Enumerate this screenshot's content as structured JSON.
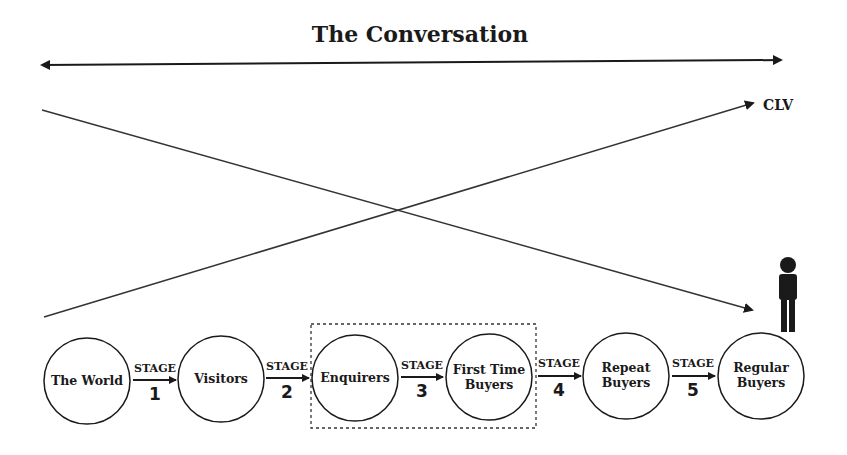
{
  "title": "The Conversation",
  "clv_label": "CLV",
  "colors": {
    "ink": "#1a1a1a",
    "background": "#ffffff"
  },
  "nodes": [
    {
      "id": "the-world",
      "lines": [
        "The World"
      ],
      "cx": 87,
      "cy": 381
    },
    {
      "id": "visitors",
      "lines": [
        "Visitors"
      ],
      "cx": 221,
      "cy": 379
    },
    {
      "id": "enquirers",
      "lines": [
        "Enquirers"
      ],
      "cx": 355,
      "cy": 378
    },
    {
      "id": "first-time-buyers",
      "lines": [
        "First Time",
        "Buyers"
      ],
      "cx": 489,
      "cy": 377
    },
    {
      "id": "repeat-buyers",
      "lines": [
        "Repeat",
        "Buyers"
      ],
      "cx": 626,
      "cy": 376
    },
    {
      "id": "regular-buyers",
      "lines": [
        "Regular",
        "Buyers"
      ],
      "cx": 761,
      "cy": 376
    }
  ],
  "stages": [
    {
      "label": "STAGE",
      "number": "1"
    },
    {
      "label": "STAGE",
      "number": "2"
    },
    {
      "label": "STAGE",
      "number": "3"
    },
    {
      "label": "STAGE",
      "number": "4"
    },
    {
      "label": "STAGE",
      "number": "5"
    }
  ],
  "highlight_box": {
    "label": "Enquirers to First Time Buyers focus",
    "x": 311,
    "y": 324,
    "width": 225,
    "height": 104
  },
  "icons": {
    "person": "person-icon"
  }
}
